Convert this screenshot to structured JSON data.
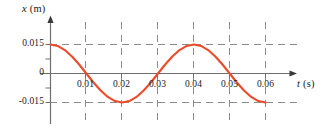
{
  "figure": {
    "name": "displacement-vs-time-graph",
    "background_color": "#ffffff"
  },
  "axes": {
    "y_title": "x (m)",
    "y_title_variable": "x",
    "y_title_unit": "(m)",
    "x_title": "t (s)",
    "x_title_variable": "t",
    "x_title_unit": "(s)",
    "axis_color": "#6e6e73",
    "grid_color": "#8c8c8c",
    "curve_color": "#ee4a29"
  },
  "chart_data": {
    "type": "line",
    "title": "",
    "xlabel": "t (s)",
    "ylabel": "x (m)",
    "xlim": [
      0,
      0.062
    ],
    "ylim": [
      -0.021,
      0.021
    ],
    "grid": true,
    "legend": null,
    "xticks": [
      0.01,
      0.02,
      0.03,
      0.04,
      0.05,
      0.06
    ],
    "xtick_labels": [
      "0.01",
      "0.02",
      "0.03",
      "0.04",
      "0.05",
      "0.06"
    ],
    "yticks": [
      0.015,
      0,
      -0.015
    ],
    "ytick_labels": [
      "0.015",
      "0",
      "-0.015"
    ],
    "function": "x = 0.015 * cos(2*pi*t / 0.04)",
    "amplitude": 0.015,
    "period": 0.04,
    "frequency": 25,
    "phase": 0,
    "x": [
      0,
      0.002,
      0.004,
      0.006,
      0.008,
      0.01,
      0.012,
      0.014,
      0.016,
      0.018,
      0.02,
      0.022,
      0.024,
      0.026,
      0.028,
      0.03,
      0.032,
      0.034,
      0.036,
      0.038,
      0.04,
      0.042,
      0.044,
      0.046,
      0.048,
      0.05,
      0.052,
      0.054,
      0.056,
      0.058,
      0.06
    ],
    "values": [
      0.015,
      0.01427,
      0.01213,
      0.00882,
      0.00464,
      0.0,
      -0.00464,
      -0.00882,
      -0.01213,
      -0.01427,
      -0.015,
      -0.01427,
      -0.01213,
      -0.00882,
      -0.00464,
      0.0,
      0.00464,
      0.00882,
      0.01213,
      0.01427,
      0.015,
      0.01427,
      0.01213,
      0.00882,
      0.00464,
      0.0,
      -0.00464,
      -0.00882,
      -0.01213,
      -0.01427,
      -0.015
    ],
    "annotations": []
  },
  "ticks": {
    "y": [
      {
        "label": "0.015",
        "value": 0.015
      },
      {
        "label": "0",
        "value": 0
      },
      {
        "label": "-0.015",
        "value": -0.015
      }
    ],
    "x": [
      {
        "label": "0.01",
        "value": 0.01
      },
      {
        "label": "0.02",
        "value": 0.02
      },
      {
        "label": "0.03",
        "value": 0.03
      },
      {
        "label": "0.04",
        "value": 0.04
      },
      {
        "label": "0.05",
        "value": 0.05
      },
      {
        "label": "0.06",
        "value": 0.06
      }
    ]
  }
}
